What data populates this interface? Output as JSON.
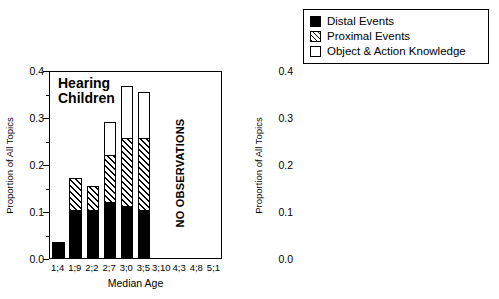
{
  "legend": {
    "items": [
      {
        "label": "Distal Events",
        "swatch": "solid-black-square-icon",
        "color": "#000000"
      },
      {
        "label": "Proximal Events",
        "swatch": "diagonal-hatch-square-icon",
        "color": "#000000"
      },
      {
        "label": "Object & Action Knowledge",
        "swatch": "open-white-square-icon",
        "color": "#ffffff"
      }
    ]
  },
  "axis": {
    "ylabel": "Proportion of All Topics",
    "xlabel": "Median Age",
    "yticks": [
      "0.0",
      "0.1",
      "0.2",
      "0.3",
      "0.4"
    ],
    "ylim": [
      0.0,
      0.4
    ],
    "ytick_step": 0.1,
    "yminor_step": 0.05
  },
  "panels": [
    {
      "id": "hearing",
      "title": "Hearing\nChildren",
      "note": "NO OBSERVATIONS"
    },
    {
      "id": "deaf",
      "title": "Deaf\nChildren",
      "note": ""
    }
  ],
  "chart_data": [
    {
      "type": "bar",
      "title": "Hearing Children",
      "subtitle": "",
      "xlabel": "Median Age",
      "ylabel": "Proportion of All Topics",
      "ylim": [
        0.0,
        0.4
      ],
      "grid": false,
      "stacked": true,
      "legend_position": "top-right",
      "annotation": "NO OBSERVATIONS",
      "categories": [
        "1;4",
        "1;9",
        "2;2",
        "2;7",
        "3;0",
        "3;5",
        "3;10",
        "4;3",
        "4;8",
        "5;1"
      ],
      "series": [
        {
          "name": "Distal Events",
          "values": [
            0.035,
            0.103,
            0.103,
            0.12,
            0.11,
            0.103,
            null,
            null,
            null,
            null
          ]
        },
        {
          "name": "Proximal Events",
          "values": [
            0.0,
            0.067,
            0.05,
            0.1,
            0.145,
            0.153,
            null,
            null,
            null,
            null
          ]
        },
        {
          "name": "Object & Action Knowledge",
          "values": [
            0.0,
            0.0,
            0.0,
            0.07,
            0.11,
            0.097,
            null,
            null,
            null,
            null
          ]
        }
      ],
      "cumulative_tops": [
        0.035,
        0.17,
        0.153,
        0.29,
        0.365,
        0.353,
        null,
        null,
        null,
        null
      ]
    },
    {
      "type": "bar",
      "title": "Deaf Children",
      "subtitle": "",
      "xlabel": "Median Age",
      "ylabel": "Proportion of All Topics",
      "ylim": [
        0.0,
        0.4
      ],
      "grid": false,
      "stacked": true,
      "legend_position": "top-right",
      "annotation": "",
      "categories": [
        "1;4",
        "1;9",
        "2;2",
        "2;7",
        "3;0",
        "3;5",
        "3;10",
        "4;3",
        "4;8",
        "5;1"
      ],
      "series": [
        {
          "name": "Distal Events",
          "values": [
            null,
            null,
            null,
            0.085,
            0.068,
            0.115,
            0.155,
            0.085,
            0.25,
            0.12
          ]
        },
        {
          "name": "Proximal Events",
          "values": [
            null,
            null,
            null,
            0.0,
            0.032,
            0.045,
            0.052,
            0.052,
            0.037,
            0.058
          ]
        },
        {
          "name": "Object & Action Knowledge",
          "values": [
            null,
            null,
            null,
            0.0,
            0.0,
            0.0,
            0.013,
            0.008,
            0.043,
            0.032
          ]
        }
      ],
      "cumulative_tops": [
        null,
        null,
        null,
        0.085,
        0.1,
        0.16,
        0.22,
        0.145,
        0.33,
        0.21
      ]
    }
  ]
}
